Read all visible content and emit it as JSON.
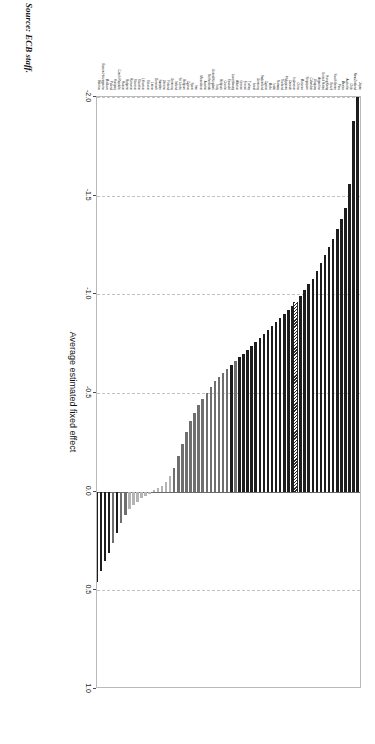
{
  "figure": {
    "source_note": "Source: ECB staff.",
    "xlabel": "Average estimated fixed effect"
  },
  "chart_data": {
    "type": "bar",
    "orientation": "horizontal",
    "title": "",
    "subtitle": "",
    "xlabel": "Average estimated fixed effect",
    "ylabel": "",
    "xlim": [
      -2.0,
      1.0
    ],
    "ylim": null,
    "xticks": [
      -2.0,
      -1.5,
      -1.0,
      -0.5,
      0.0,
      0.5,
      1.0
    ],
    "xticklabels": [
      "-2.0",
      "-1.5",
      "-1.0",
      "-0.5",
      "0.0",
      "0.5",
      "1.0"
    ],
    "grid": "vertical-dashed",
    "legend": null,
    "annotations": [
      "Source: ECB staff."
    ],
    "sorted": "ascending by value (most negative first)",
    "categories": [
      "Japan",
      "New Zealand",
      "Chile",
      "Australia",
      "Mexico",
      "Peru",
      "South Korea",
      "Brazil",
      "Hong Kong",
      "United States",
      "Argentina",
      "Uruguay",
      "Colombia",
      "Singapore",
      "Morocco",
      "China",
      "Indonesia",
      "Canada",
      "Philippines",
      "Thailand",
      "Norway",
      "India",
      "Malta",
      "Cyprus",
      "Switzerland",
      "Germany",
      "Israel",
      "Turkey",
      "France",
      "Greece",
      "Albania",
      "Luxembourg",
      "Ecuador",
      "Croatia",
      "Belgium",
      "Italy",
      "United Kingdom",
      "Netherlands",
      "Austria",
      "Macedonia",
      "Iran",
      "Spain",
      "Cyprus (2)",
      "Belgium (2)",
      "Sri Lanka",
      "Ireland",
      "Germany (2)",
      "Finland",
      "Ukraine",
      "Sweden",
      "Denmark",
      "Latvia",
      "Estonia",
      "Lithuania",
      "Slovakia",
      "Slovenia",
      "Romania",
      "Bulgaria",
      "Russia",
      "Czech Republic",
      "Hungary",
      "Poland",
      "Moldova",
      "Bosnia-Herzegovina",
      "Belarus"
    ],
    "values": [
      -2.0,
      -1.88,
      -1.56,
      -1.44,
      -1.38,
      -1.33,
      -1.28,
      -1.24,
      -1.2,
      -1.16,
      -1.12,
      -1.08,
      -1.05,
      -1.02,
      -0.99,
      -0.96,
      -0.94,
      -0.92,
      -0.9,
      -0.88,
      -0.86,
      -0.84,
      -0.82,
      -0.8,
      -0.78,
      -0.76,
      -0.74,
      -0.72,
      -0.7,
      -0.68,
      -0.66,
      -0.64,
      -0.62,
      -0.6,
      -0.58,
      -0.56,
      -0.53,
      -0.5,
      -0.47,
      -0.44,
      -0.4,
      -0.36,
      -0.3,
      -0.24,
      -0.18,
      -0.12,
      -0.08,
      -0.05,
      -0.03,
      -0.02,
      -0.01,
      0.01,
      0.02,
      0.03,
      0.05,
      0.07,
      0.09,
      0.12,
      0.16,
      0.21,
      0.26,
      0.31,
      0.35,
      0.4,
      0.46
    ],
    "bar_styles": [
      "dark",
      "dark",
      "dark",
      "dark",
      "dark",
      "dark",
      "dark",
      "dark",
      "dark",
      "dark",
      "dark",
      "dark",
      "dark",
      "dark",
      "dark",
      "hatch",
      "dark",
      "dark",
      "dark",
      "dark",
      "dark",
      "dark",
      "dark",
      "dark",
      "dark",
      "dark",
      "dark",
      "dark",
      "dark",
      "dark",
      "mid",
      "dark",
      "mid",
      "mid",
      "mid",
      "mid",
      "mid",
      "mid",
      "mid",
      "mid",
      "mid",
      "mid",
      "mid",
      "mid",
      "mid",
      "mid",
      "light",
      "light",
      "light",
      "light",
      "light",
      "light",
      "light",
      "light",
      "light",
      "light",
      "light",
      "mid",
      "mid",
      "dark",
      "mid",
      "dark",
      "dark",
      "dark",
      "dark"
    ]
  }
}
